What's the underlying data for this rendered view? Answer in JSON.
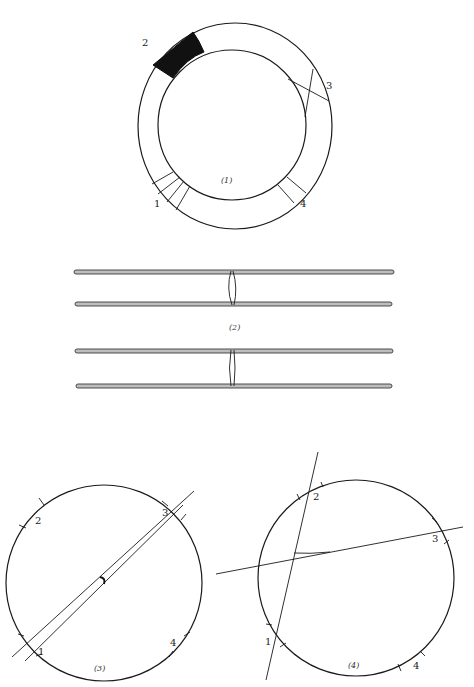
{
  "figures": [
    {
      "id": "fig1",
      "caption": "(1)",
      "description": "Annular ring with marked sectors",
      "labels": {
        "sector1": "1",
        "sector2": "2",
        "sector3": "3",
        "sector4": "4"
      }
    },
    {
      "id": "fig2",
      "caption": "(2)",
      "description": "Two pairs of parallel rods joined by a loop"
    },
    {
      "id": "fig3",
      "caption": "(3)",
      "description": "Circle with ticks and nearly parallel chords",
      "labels": {
        "point1": "1",
        "point2": "2",
        "point3": "3",
        "point4": "4"
      }
    },
    {
      "id": "fig4",
      "caption": "(4)",
      "description": "Circle with ticks and two crossing lines",
      "labels": {
        "point1": "1",
        "point2": "2",
        "point3": "3",
        "point4": "4"
      }
    }
  ],
  "colors": {
    "ink": "#1a1a1a",
    "rod_fill": "#bdbdbd",
    "background": "#ffffff"
  }
}
